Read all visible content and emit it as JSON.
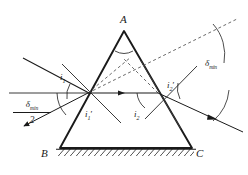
{
  "figure": {
    "kind": "optics-ray-diagram",
    "background": "#ffffff",
    "stroke_color": "#1a1a1a",
    "prism": {
      "apex_label": "A",
      "base_left_label": "B",
      "base_right_label": "C",
      "apex": {
        "x": 124,
        "y": 31
      },
      "base_left": {
        "x": 60,
        "y": 148
      },
      "base_right": {
        "x": 192,
        "y": 148
      },
      "hatched_base": true
    },
    "rays": {
      "incident": {
        "from": {
          "x": 24,
          "y": 59
        },
        "to": {
          "x": 88,
          "y": 93
        }
      },
      "internal": {
        "from": {
          "x": 88,
          "y": 93
        },
        "to": {
          "x": 158,
          "y": 93
        },
        "arrow_at": {
          "x": 122,
          "y": 93
        }
      },
      "emergent": {
        "from": {
          "x": 158,
          "y": 93
        },
        "to": {
          "x": 240,
          "y": 131
        },
        "arrow_at": {
          "x": 214,
          "y": 119
        }
      },
      "reference_horizontal": {
        "from": {
          "x": 10,
          "y": 93
        },
        "to": {
          "x": 88,
          "y": 93
        }
      },
      "reference_deviated": {
        "from": {
          "x": 88,
          "y": 93
        },
        "to": {
          "x": 22,
          "y": 127
        },
        "arrow_at": {
          "x": 30,
          "y": 123
        }
      },
      "dashed_extension": {
        "from": {
          "x": 88,
          "y": 93
        },
        "to": {
          "x": 236,
          "y": 20
        }
      },
      "dashed_to_apex_left": {
        "from": {
          "x": 88,
          "y": 93
        },
        "to": {
          "x": 130,
          "y": 58
        }
      },
      "dashed_to_apex_right": {
        "from": {
          "x": 158,
          "y": 93
        },
        "to": {
          "x": 124,
          "y": 60
        }
      },
      "normal_entry": {
        "from": {
          "x": 62,
          "y": 64
        },
        "to": {
          "x": 120,
          "y": 122
        }
      },
      "normal_exit": {
        "from": {
          "x": 140,
          "y": 62
        },
        "to": {
          "x": 180,
          "y": 128
        }
      },
      "normal_exit_outer": {
        "from": {
          "x": 196,
          "y": 67
        },
        "to": {
          "x": 146,
          "y": 118
        }
      }
    },
    "labels": {
      "apex": "A",
      "base_left": "B",
      "base_right": "C",
      "angle_i1": "i",
      "angle_i1_sub": "1",
      "angle_i1_prime": "i",
      "angle_i1_prime_sub": "1",
      "angle_i1_prime_mark": "′",
      "angle_i2": "i",
      "angle_i2_sub": "2",
      "angle_i2_prime": "i",
      "angle_i2_prime_sub": "2",
      "angle_i2_prime_mark": "′",
      "delta_min_symbol": "δ",
      "delta_min_subscript": "min",
      "half_denominator": "2"
    }
  }
}
